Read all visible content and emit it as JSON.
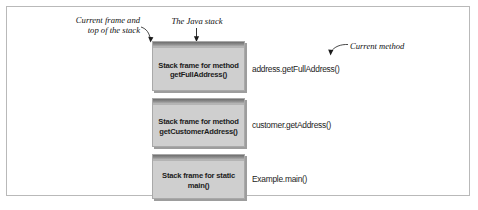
{
  "figure": {
    "title": "The Java stack",
    "background_color": "#ffffff",
    "frame_color": "#b9b9b9",
    "box_fill_color": "#cfcfcf",
    "box_cap_color": "#6f6f6f",
    "text_color": "#1c1c1c"
  },
  "annotations": [
    {
      "id": "current-frame",
      "line1": "Current frame and",
      "line2": "top of the stack",
      "points_to": "top-left corner of top stack frame"
    },
    {
      "id": "java-stack",
      "text": "The Java stack",
      "points_to": "top edge of top stack frame"
    },
    {
      "id": "current-method",
      "text": "Current method",
      "points_to": "address.getFullAddress()"
    }
  ],
  "stack": {
    "frames": [
      {
        "box_line1": "Stack frame for method",
        "box_line2": "getFullAddress()",
        "call": "address.getFullAddress()"
      },
      {
        "box_line1": "Stack frame for method",
        "box_line2": "getCustomerAddress()",
        "call": "customer.getAddress()"
      },
      {
        "box_line1": "Stack frame for static",
        "box_line2": "main()",
        "call": "Example.main()"
      }
    ]
  }
}
